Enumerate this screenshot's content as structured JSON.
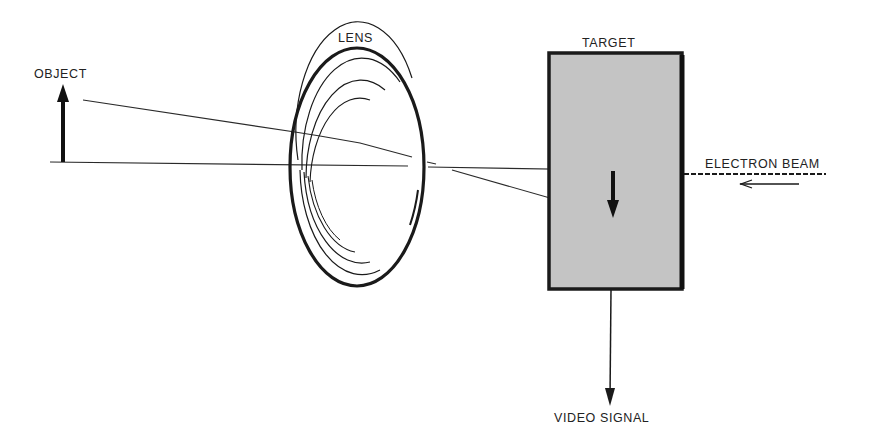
{
  "diagram": {
    "labels": {
      "object": "OBJECT",
      "lens": "LENS",
      "target": "TARGET",
      "electron_beam": "ELECTRON BEAM",
      "video_signal": "VIDEO SIGNAL"
    },
    "colors": {
      "ink": "#1e1e1e",
      "target_fill": "#c4c4c4",
      "background": "#ffffff"
    }
  }
}
